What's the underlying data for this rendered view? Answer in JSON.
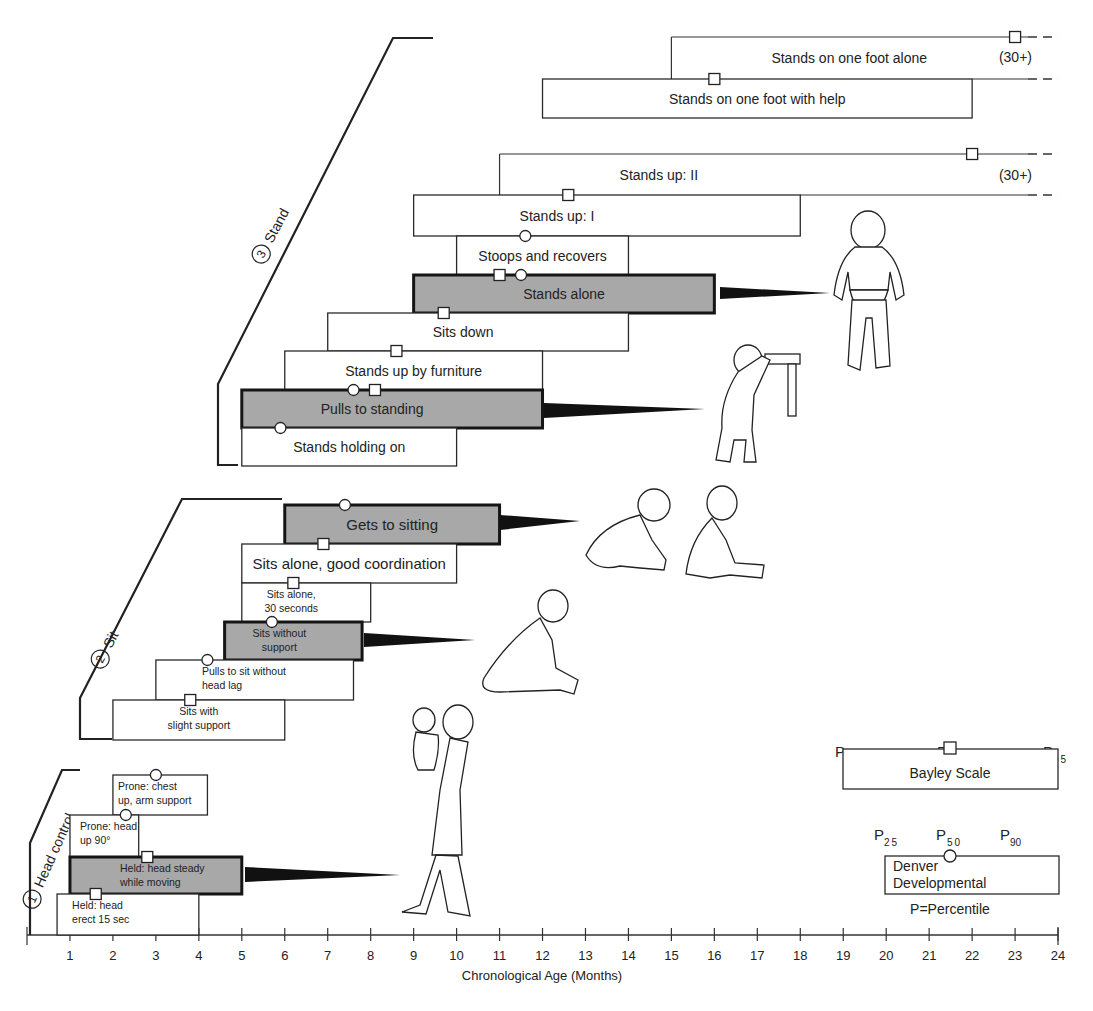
{
  "chart_data": {
    "type": "gantt-range",
    "title": "",
    "xlabel": "Chronological Age (Months)",
    "ylabel": "",
    "xlim": [
      0,
      24
    ],
    "x_ticks": [
      1,
      2,
      3,
      4,
      5,
      6,
      7,
      8,
      9,
      10,
      11,
      12,
      13,
      14,
      15,
      16,
      17,
      18,
      19,
      20,
      21,
      22,
      23,
      24
    ],
    "grid": false,
    "groups": [
      {
        "number": "1",
        "name": "Head control"
      },
      {
        "number": "2",
        "name": "Sit"
      },
      {
        "number": "3",
        "name": "Stand"
      }
    ],
    "milestones": [
      {
        "group": "Head control",
        "label": "Held: head erect 15 sec",
        "start": 0.7,
        "end": 4.0,
        "bayley_p50": 1.6,
        "denver_p50": null,
        "key": false
      },
      {
        "group": "Head control",
        "label": "Held: head steady while moving",
        "start": 1.0,
        "end": 5.0,
        "bayley_p50": 2.8,
        "denver_p50": null,
        "key": true
      },
      {
        "group": "Head control",
        "label": "Prone: head up 90°",
        "start": 1.0,
        "end": 2.6,
        "bayley_p50": null,
        "denver_p50": 2.3,
        "key": false
      },
      {
        "group": "Head control",
        "label": "Prone: chest up, arm support",
        "start": 2.0,
        "end": 4.2,
        "bayley_p50": null,
        "denver_p50": 3.0,
        "key": false
      },
      {
        "group": "Sit",
        "label": "Sits with slight support",
        "start": 2.0,
        "end": 6.0,
        "bayley_p50": 3.8,
        "denver_p50": null,
        "key": false
      },
      {
        "group": "Sit",
        "label": "Pulls to sit without head lag",
        "start": 3.0,
        "end": 7.6,
        "bayley_p50": null,
        "denver_p50": 4.2,
        "key": false
      },
      {
        "group": "Sit",
        "label": "Sits without support",
        "start": 4.6,
        "end": 7.8,
        "bayley_p50": null,
        "denver_p50": 5.7,
        "key": true
      },
      {
        "group": "Sit",
        "label": "Sits alone, 30 seconds",
        "start": 5.0,
        "end": 8.0,
        "bayley_p50": 6.2,
        "denver_p50": null,
        "key": false
      },
      {
        "group": "Sit",
        "label": "Sits alone, good coordination",
        "start": 5.0,
        "end": 10.0,
        "bayley_p50": 6.9,
        "denver_p50": null,
        "key": false
      },
      {
        "group": "Sit",
        "label": "Gets to sitting",
        "start": 6.0,
        "end": 11.0,
        "bayley_p50": null,
        "denver_p50": 7.4,
        "key": true
      },
      {
        "group": "Stand",
        "label": "Stands holding on",
        "start": 5.0,
        "end": 10.0,
        "bayley_p50": null,
        "denver_p50": 5.9,
        "key": false
      },
      {
        "group": "Stand",
        "label": "Pulls to standing",
        "start": 5.0,
        "end": 12.0,
        "bayley_p50": 8.1,
        "denver_p50": 7.6,
        "key": true
      },
      {
        "group": "Stand",
        "label": "Stands up by furniture",
        "start": 6.0,
        "end": 12.0,
        "bayley_p50": 8.6,
        "denver_p50": null,
        "key": false
      },
      {
        "group": "Stand",
        "label": "Sits down",
        "start": 7.0,
        "end": 14.0,
        "bayley_p50": 9.7,
        "denver_p50": null,
        "key": false
      },
      {
        "group": "Stand",
        "label": "Stands alone",
        "start": 9.0,
        "end": 16.0,
        "bayley_p50": 11.0,
        "denver_p50": 11.5,
        "key": true
      },
      {
        "group": "Stand",
        "label": "Stoops and recovers",
        "start": 10.0,
        "end": 14.0,
        "bayley_p50": null,
        "denver_p50": 11.6,
        "key": false
      },
      {
        "group": "Stand",
        "label": "Stands up: I",
        "start": 9.0,
        "end": 18.0,
        "bayley_p50": 12.6,
        "denver_p50": null,
        "key": false
      },
      {
        "group": "Stand",
        "label": "Stands up: II",
        "start": 11.0,
        "end": "30+",
        "bayley_p50": 22.0,
        "denver_p50": null,
        "key": false
      },
      {
        "group": "Stand",
        "label": "Stands on one foot with help",
        "start": 12.0,
        "end": 22.0,
        "bayley_p50": 16.0,
        "denver_p50": null,
        "key": false
      },
      {
        "group": "Stand",
        "label": "Stands on one foot alone",
        "start": 15.0,
        "end": "30+",
        "bayley_p50": 23.0,
        "denver_p50": null,
        "key": false
      }
    ],
    "legend": {
      "bayley": {
        "label": "Bayley Scale",
        "marker": "square",
        "percentiles": [
          "P5",
          "P50",
          "P95"
        ]
      },
      "denver": {
        "label": "Denver Developmental",
        "marker": "circle",
        "percentiles": [
          "P25",
          "P50",
          "P90"
        ]
      },
      "note": "P=Percentile"
    }
  },
  "axis": {
    "label": "Chronological Age (Months)"
  },
  "groups": {
    "head": {
      "number": "1",
      "name": "Head control"
    },
    "sit": {
      "number": "2",
      "name": "Sit"
    },
    "stand": {
      "number": "3",
      "name": "Stand"
    }
  },
  "overflow_label": "(30+)",
  "legend": {
    "bayley": {
      "label": "Bayley Scale",
      "p_low": "P",
      "p_low_sub": "5",
      "p_mid": "P",
      "p_mid_sub": "50",
      "p_high": "P",
      "p_high_sub": "95"
    },
    "denver": {
      "line1": "Denver",
      "line2": "Developmental",
      "p_low": "P",
      "p_low_sub": "25",
      "p_mid": "P",
      "p_mid_sub": "50",
      "p_high": "P",
      "p_high_sub": "90"
    },
    "note": "P=Percentile"
  },
  "illustrations": [
    "mother-holding-infant",
    "infant-sitting-without-support",
    "infant-getting-to-sitting",
    "infant-sitting",
    "infant-pulling-to-stand",
    "toddler-standing-alone"
  ]
}
